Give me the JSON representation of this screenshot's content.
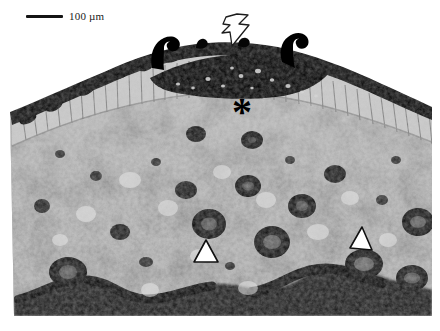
{
  "figure": {
    "kind": "light-micrograph",
    "width_px": 440,
    "height_px": 331,
    "background_color": "#ffffff"
  },
  "scalebar": {
    "label": "100 µm",
    "length_px": 37,
    "bar_color": "#141414",
    "text_color": "#1a1a1a"
  },
  "annotations": [
    {
      "id": "bolt-arrow",
      "glyph": "zigzag-arrow",
      "style": "outline-white-black-border",
      "points_to": "cuticle / trichome layer at apex",
      "x": 218,
      "y": 12,
      "fill": "#ffffff",
      "stroke": "#1c1c1c"
    },
    {
      "id": "asterisk",
      "glyph": "*",
      "style": "solid-black",
      "points_to": "palisade / epidermal cell layer",
      "x": 232,
      "y": 92,
      "fill": "#000000"
    },
    {
      "id": "arrowhead-left",
      "glyph": "triangle-up",
      "style": "outline-white-black-border",
      "points_to": "vascular bundle (left)",
      "x": 191,
      "y": 236,
      "fill": "#ffffff",
      "stroke": "#101010"
    },
    {
      "id": "arrowhead-right",
      "glyph": "triangle-up",
      "style": "outline-white-black-border",
      "points_to": "vascular bundle (right)",
      "x": 346,
      "y": 224,
      "fill": "#ffffff",
      "stroke": "#101010"
    }
  ],
  "tissue_layers": [
    {
      "name": "cuticle",
      "tone": "#0a0a0a",
      "region": "apical arch"
    },
    {
      "name": "trichomes",
      "tone": "#070707",
      "region": "apical projections"
    },
    {
      "name": "epidermis-palisade",
      "tone": "#b4b4b4",
      "region": "sub-apical band"
    },
    {
      "name": "parenchyma",
      "tone": "#a8a8a8",
      "region": "body"
    },
    {
      "name": "vascular-bundles",
      "tone": "#151515",
      "region": "scattered in body"
    },
    {
      "name": "abaxial-cuticle",
      "tone": "#0d0d0d",
      "region": "basal wavy band"
    }
  ],
  "palette": {
    "black": "#000000",
    "dark": "#141414",
    "mid_gray": "#9a9a9a",
    "light_gray": "#d8d8d8",
    "white": "#ffffff"
  }
}
